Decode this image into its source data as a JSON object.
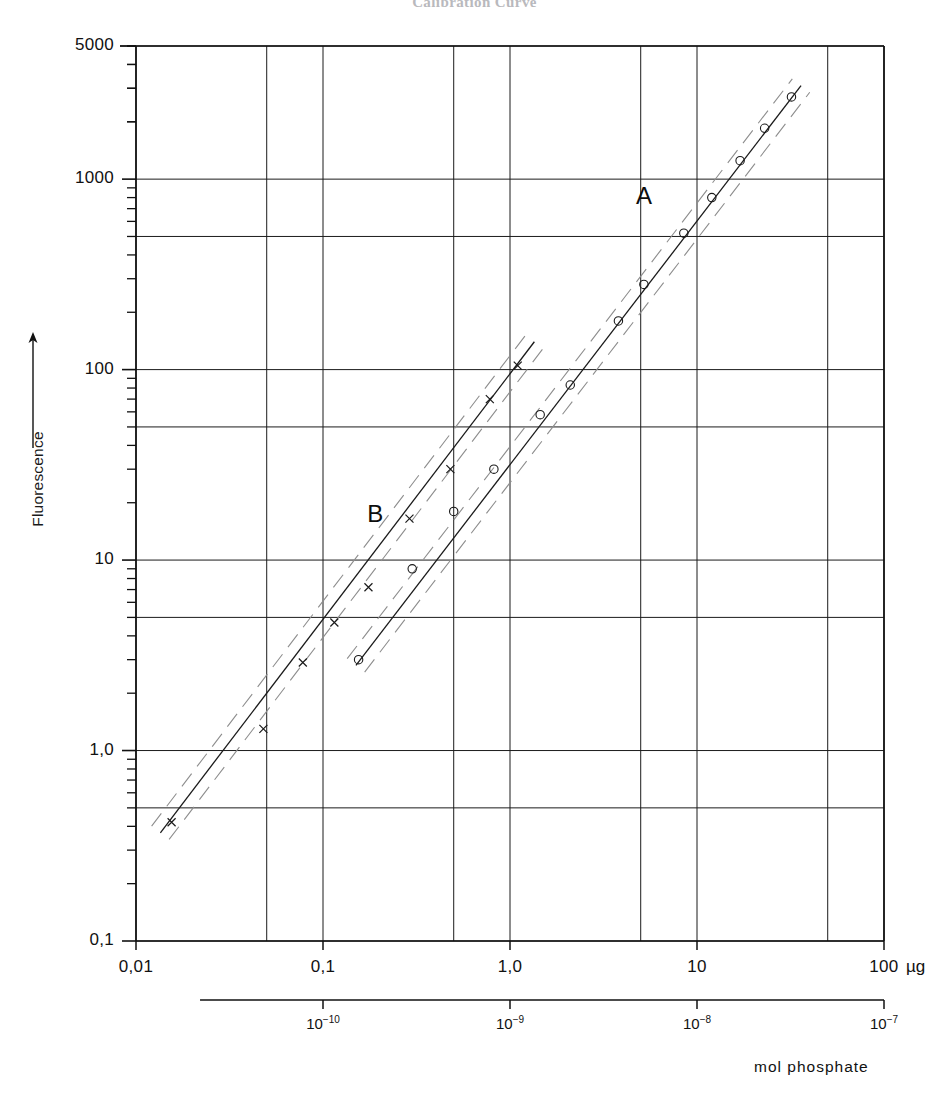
{
  "title": "Calibration Curve",
  "axes": {
    "y_label": "Fluorescence",
    "y_arrow": "up-arrow",
    "y_ticks": [
      "5000",
      "1000",
      "100",
      "10",
      "1,0",
      "0,1"
    ],
    "x_ticks": [
      "0,01",
      "0,1",
      "1,0",
      "10",
      "100"
    ],
    "x_unit": "µg",
    "x2_ticks": [
      "10-10",
      "10-9",
      "10-8",
      "10-7"
    ],
    "x2_label": "mol phosphate"
  },
  "labels": {
    "curve_a": "A",
    "curve_b": "B"
  },
  "chart_data": {
    "type": "line",
    "title": "Calibration Curve",
    "xlabel": "µg",
    "ylabel": "Fluorescence",
    "xscale": "log",
    "yscale": "log",
    "xlim": [
      0.01,
      100
    ],
    "ylim": [
      0.1,
      5000
    ],
    "grid": true,
    "grid_x_values": [
      0.01,
      0.05,
      0.1,
      0.5,
      1.0,
      5.0,
      10,
      50,
      100
    ],
    "grid_y_values": [
      0.1,
      0.5,
      1.0,
      5,
      10,
      50,
      100,
      500,
      1000,
      5000
    ],
    "x_tick_values": [
      0.01,
      0.1,
      1.0,
      10,
      100
    ],
    "x_tick_labels": [
      "0,01",
      "0,1",
      "1,0",
      "10",
      "100"
    ],
    "y_tick_values": [
      0.1,
      1.0,
      10,
      100,
      1000,
      5000
    ],
    "y_tick_labels": [
      "0,1",
      "1,0",
      "10",
      "100",
      "1000",
      "5000"
    ],
    "secondary_x_tick_values": [
      0.1,
      1.0,
      10,
      100
    ],
    "secondary_x_tick_labels": [
      "10-10",
      "10-9",
      "10-8",
      "10-7"
    ],
    "secondary_x_label": "mol phosphate",
    "legend": "inline-labels",
    "series": [
      {
        "name": "A",
        "marker": "open-circle",
        "line": "solid",
        "band": "dashed",
        "annotation": "A",
        "annotation_x": 5.2,
        "annotation_y": 800,
        "points": [
          {
            "x": 0.155,
            "y": 3.0
          },
          {
            "x": 0.3,
            "y": 9.0
          },
          {
            "x": 0.5,
            "y": 18.0
          },
          {
            "x": 0.82,
            "y": 30.0
          },
          {
            "x": 1.45,
            "y": 58.0
          },
          {
            "x": 2.1,
            "y": 83.0
          },
          {
            "x": 3.8,
            "y": 180.0
          },
          {
            "x": 5.2,
            "y": 280.0
          },
          {
            "x": 8.5,
            "y": 520.0
          },
          {
            "x": 12.0,
            "y": 800.0
          },
          {
            "x": 17.0,
            "y": 1250.0
          },
          {
            "x": 23.0,
            "y": 1850.0
          },
          {
            "x": 32.0,
            "y": 2700.0
          }
        ],
        "fit_from": {
          "x": 0.15,
          "y": 2.8
        },
        "fit_to": {
          "x": 36.0,
          "y": 3100.0
        }
      },
      {
        "name": "B",
        "marker": "cross",
        "line": "solid",
        "band": "dashed",
        "annotation": "B",
        "annotation_x": 0.19,
        "annotation_y": 17.0,
        "points": [
          {
            "x": 0.0155,
            "y": 0.42
          },
          {
            "x": 0.048,
            "y": 1.3
          },
          {
            "x": 0.078,
            "y": 2.9
          },
          {
            "x": 0.115,
            "y": 4.7
          },
          {
            "x": 0.175,
            "y": 7.2
          },
          {
            "x": 0.29,
            "y": 16.5
          },
          {
            "x": 0.48,
            "y": 30.0
          },
          {
            "x": 0.78,
            "y": 70.0
          },
          {
            "x": 1.1,
            "y": 105.0
          }
        ],
        "fit_from": {
          "x": 0.0135,
          "y": 0.37
        },
        "fit_to": {
          "x": 1.35,
          "y": 140.0
        }
      }
    ]
  }
}
